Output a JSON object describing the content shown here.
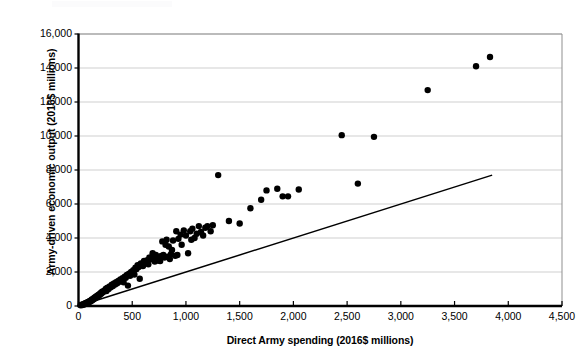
{
  "chart_data": {
    "type": "scatter",
    "title": "",
    "xlabel": "Direct Army spending (2016$ millions)",
    "ylabel": "Army-driven economic output (2016$ millions)",
    "xlim": [
      0,
      4500
    ],
    "ylim": [
      0,
      16000
    ],
    "xticks": [
      0,
      500,
      1000,
      1500,
      2000,
      2500,
      3000,
      3500,
      4000,
      4500
    ],
    "xtick_labels": [
      "0",
      "500",
      "1,000",
      "1,500",
      "2,000",
      "2,500",
      "3,000",
      "3,500",
      "4,000",
      "4,500"
    ],
    "yticks": [
      0,
      2000,
      4000,
      6000,
      8000,
      10000,
      12000,
      14000,
      16000
    ],
    "ytick_labels": [
      "0",
      "2,000",
      "4,000",
      "6,000",
      "8,000",
      "10,000",
      "12,000",
      "14,000",
      "16,000"
    ],
    "grid": "horizontal",
    "legend": "none",
    "marker_color": "#000000",
    "marker_size": 3.2,
    "gridline_color": "#c9c9c9",
    "axis_color": "#000000",
    "reference_line": {
      "name": "1-to-2 reference line",
      "color": "#000000",
      "x": [
        0,
        3850
      ],
      "y": [
        0,
        7700
      ],
      "slope": 2.0
    },
    "series": [
      {
        "name": "Army installations",
        "points": [
          [
            20,
            40
          ],
          [
            30,
            70
          ],
          [
            35,
            60
          ],
          [
            45,
            110
          ],
          [
            50,
            95
          ],
          [
            55,
            140
          ],
          [
            60,
            120
          ],
          [
            65,
            170
          ],
          [
            70,
            150
          ],
          [
            75,
            200
          ],
          [
            80,
            180
          ],
          [
            85,
            230
          ],
          [
            90,
            210
          ],
          [
            95,
            260
          ],
          [
            100,
            240
          ],
          [
            105,
            300
          ],
          [
            110,
            270
          ],
          [
            115,
            330
          ],
          [
            120,
            310
          ],
          [
            125,
            380
          ],
          [
            130,
            350
          ],
          [
            135,
            420
          ],
          [
            140,
            400
          ],
          [
            145,
            470
          ],
          [
            150,
            440
          ],
          [
            155,
            520
          ],
          [
            160,
            490
          ],
          [
            165,
            560
          ],
          [
            170,
            530
          ],
          [
            175,
            610
          ],
          [
            180,
            580
          ],
          [
            185,
            650
          ],
          [
            190,
            620
          ],
          [
            195,
            700
          ],
          [
            200,
            670
          ],
          [
            205,
            760
          ],
          [
            210,
            720
          ],
          [
            215,
            810
          ],
          [
            220,
            780
          ],
          [
            225,
            860
          ],
          [
            230,
            830
          ],
          [
            240,
            900
          ],
          [
            250,
            950
          ],
          [
            255,
            1020
          ],
          [
            260,
            880
          ],
          [
            270,
            1080
          ],
          [
            280,
            1000
          ],
          [
            290,
            1150
          ],
          [
            300,
            1100
          ],
          [
            310,
            1250
          ],
          [
            320,
            1180
          ],
          [
            330,
            1320
          ],
          [
            340,
            1270
          ],
          [
            350,
            1400
          ],
          [
            360,
            1340
          ],
          [
            370,
            1480
          ],
          [
            380,
            1420
          ],
          [
            390,
            1560
          ],
          [
            400,
            1500
          ],
          [
            410,
            1640
          ],
          [
            420,
            1400
          ],
          [
            430,
            1720
          ],
          [
            440,
            1660
          ],
          [
            450,
            1820
          ],
          [
            460,
            1200
          ],
          [
            470,
            1900
          ],
          [
            480,
            1780
          ],
          [
            490,
            2000
          ],
          [
            500,
            1950
          ],
          [
            510,
            2100
          ],
          [
            520,
            1850
          ],
          [
            530,
            2250
          ],
          [
            540,
            2180
          ],
          [
            550,
            2400
          ],
          [
            560,
            2300
          ],
          [
            570,
            1600
          ],
          [
            580,
            2500
          ],
          [
            600,
            2350
          ],
          [
            610,
            2650
          ],
          [
            620,
            2550
          ],
          [
            640,
            2700
          ],
          [
            650,
            2450
          ],
          [
            660,
            2850
          ],
          [
            680,
            2750
          ],
          [
            690,
            3100
          ],
          [
            700,
            2900
          ],
          [
            710,
            2620
          ],
          [
            720,
            3000
          ],
          [
            730,
            2720
          ],
          [
            740,
            2680
          ],
          [
            750,
            2800
          ],
          [
            760,
            2640
          ],
          [
            770,
            2950
          ],
          [
            780,
            3800
          ],
          [
            790,
            3000
          ],
          [
            800,
            2850
          ],
          [
            810,
            3600
          ],
          [
            820,
            3900
          ],
          [
            830,
            2900
          ],
          [
            840,
            3500
          ],
          [
            850,
            2760
          ],
          [
            860,
            3050
          ],
          [
            870,
            3300
          ],
          [
            880,
            3850
          ],
          [
            900,
            2950
          ],
          [
            910,
            4400
          ],
          [
            920,
            3000
          ],
          [
            930,
            3950
          ],
          [
            950,
            4200
          ],
          [
            960,
            3600
          ],
          [
            980,
            4450
          ],
          [
            1000,
            4150
          ],
          [
            1020,
            3100
          ],
          [
            1040,
            4400
          ],
          [
            1050,
            3900
          ],
          [
            1060,
            4550
          ],
          [
            1080,
            4000
          ],
          [
            1100,
            4250
          ],
          [
            1120,
            4700
          ],
          [
            1140,
            4350
          ],
          [
            1160,
            4150
          ],
          [
            1180,
            4600
          ],
          [
            1200,
            4700
          ],
          [
            1230,
            4400
          ],
          [
            1250,
            4750
          ],
          [
            1300,
            7700
          ],
          [
            1400,
            5000
          ],
          [
            1500,
            4850
          ],
          [
            1600,
            5750
          ],
          [
            1700,
            6250
          ],
          [
            1750,
            6800
          ],
          [
            1850,
            6900
          ],
          [
            1900,
            6450
          ],
          [
            1950,
            6450
          ],
          [
            2050,
            6850
          ],
          [
            2450,
            10050
          ],
          [
            2600,
            7200
          ],
          [
            2750,
            9950
          ],
          [
            3250,
            12700
          ],
          [
            3700,
            14100
          ],
          [
            3830,
            14650
          ]
        ]
      }
    ]
  },
  "axis": {
    "y_title": "Army-driven economic output (2016$ millions)",
    "x_title": "Direct Army spending (2016$ millions)"
  }
}
